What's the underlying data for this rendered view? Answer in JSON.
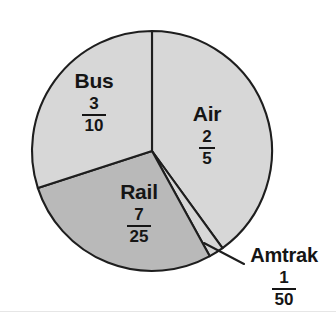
{
  "figure": {
    "background_color": "#ffffff",
    "outline_color": "#1e1e1e"
  },
  "chart_data": {
    "type": "pie",
    "title": "",
    "subtitle": "",
    "xlabel": "",
    "ylabel": "",
    "legend_position": "none",
    "labels_position": "inside-slices-with-callout",
    "grid": false,
    "total": 1,
    "categories": [
      "Air",
      "Amtrak",
      "Rail",
      "Bus"
    ],
    "values": [
      0.4,
      0.02,
      0.28,
      0.3
    ],
    "fractions": [
      "2/5",
      "1/50",
      "7/25",
      "3/10"
    ],
    "slices": [
      {
        "name": "Air",
        "label": "Air",
        "fraction_numerator": "2",
        "fraction_denominator": "5",
        "value": 0.4,
        "percent": 40,
        "angle_degrees": 144,
        "start_angle_degrees": 0,
        "end_angle_degrees": 144,
        "color": "#d7d7d7",
        "callout": false
      },
      {
        "name": "Amtrak",
        "label": "Amtrak",
        "fraction_numerator": "1",
        "fraction_denominator": "50",
        "value": 0.02,
        "percent": 2,
        "angle_degrees": 7.2,
        "start_angle_degrees": 144,
        "end_angle_degrees": 151.2,
        "color": "#d7d7d7",
        "callout": true
      },
      {
        "name": "Rail",
        "label": "Rail",
        "fraction_numerator": "7",
        "fraction_denominator": "25",
        "value": 0.28,
        "percent": 28,
        "angle_degrees": 100.8,
        "start_angle_degrees": 151.2,
        "end_angle_degrees": 252,
        "color": "#b9b9b9",
        "callout": false
      },
      {
        "name": "Bus",
        "label": "Bus",
        "fraction_numerator": "3",
        "fraction_denominator": "10",
        "value": 0.3,
        "percent": 30,
        "angle_degrees": 108,
        "start_angle_degrees": 252,
        "end_angle_degrees": 360,
        "color": "#d7d7d7",
        "callout": false
      }
    ],
    "geometry": {
      "center_x": 152,
      "center_y": 151,
      "radius": 120
    }
  }
}
